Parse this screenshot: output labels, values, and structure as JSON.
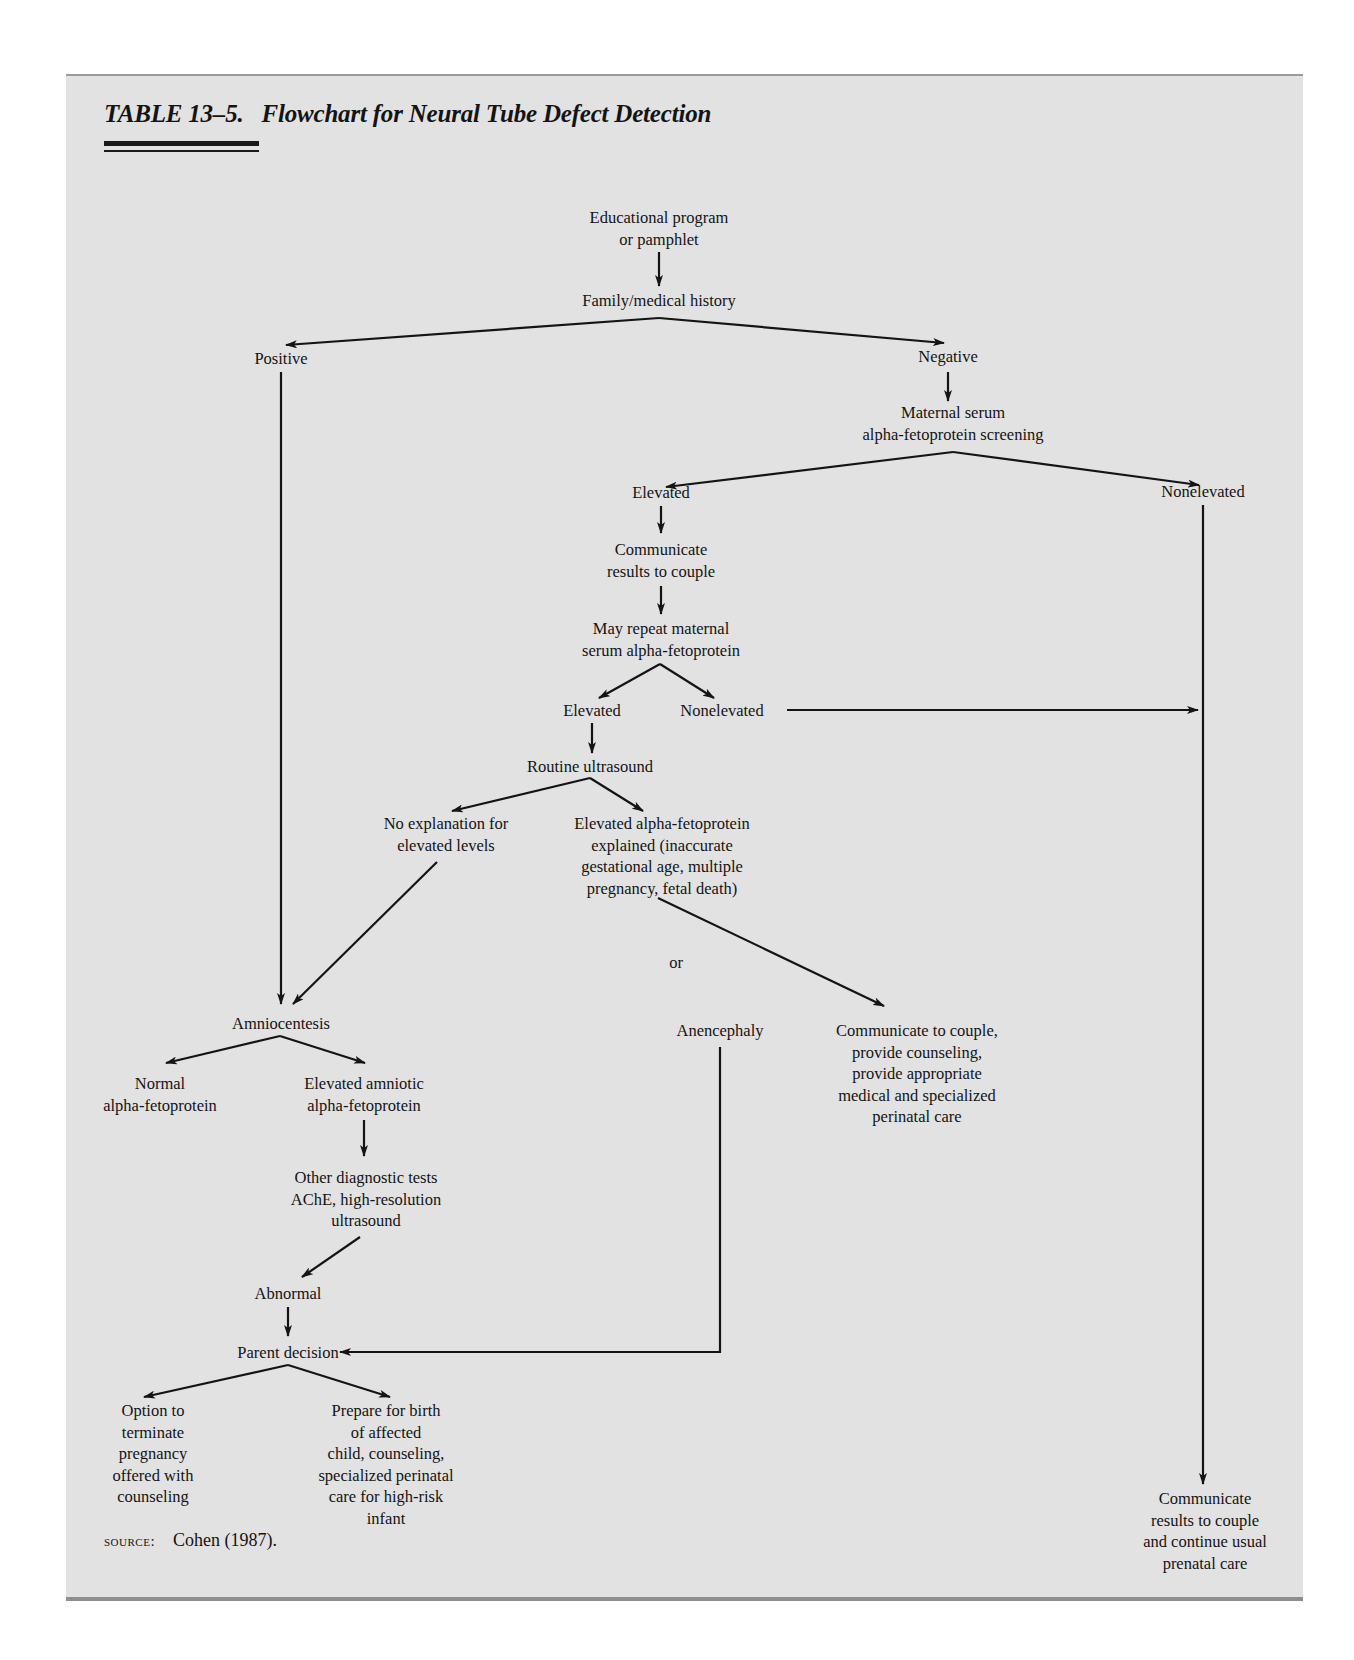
{
  "table": {
    "number": "TABLE 13–5.",
    "title": "Flowchart for Neural Tube Defect Detection"
  },
  "nodes": {
    "educational": "Educational program\nor pamphlet",
    "family_history": "Family/medical history",
    "positive": "Positive",
    "negative": "Negative",
    "msafp_screening": "Maternal serum\nalpha-fetoprotein screening",
    "elevated_1": "Elevated",
    "nonelevated_1": "Nonelevated",
    "communicate_results": "Communicate\nresults to couple",
    "may_repeat": "May repeat maternal\nserum alpha-fetoprotein",
    "elevated_2": "Elevated",
    "nonelevated_2": "Nonelevated",
    "routine_ultrasound": "Routine ultrasound",
    "no_explanation": "No explanation for\nelevated levels",
    "afp_explained": "Elevated alpha-fetoprotein\nexplained (inaccurate\ngestational age, multiple\npregnancy, fetal death)",
    "or": "or",
    "amniocentesis": "Amniocentesis",
    "anencephaly": "Anencephaly",
    "communicate_counseling": "Communicate to couple,\nprovide counseling,\nprovide appropriate\nmedical and specialized\nperinatal care",
    "normal_afp": "Normal\nalpha-fetoprotein",
    "elevated_amniotic": "Elevated amniotic\nalpha-fetoprotein",
    "other_tests": "Other diagnostic tests\nAChE, high-resolution\nultrasound",
    "abnormal": "Abnormal",
    "parent_decision": "Parent decision",
    "option_terminate": "Option to\nterminate\npregnancy\noffered with\ncounseling",
    "prepare_birth": "Prepare for birth\nof affected\nchild, counseling,\nspecialized perinatal\ncare for high-risk\ninfant",
    "communicate_usual": "Communicate\nresults to couple\nand continue usual\nprenatal care"
  },
  "source": {
    "label": "SOURCE:",
    "citation": "Cohen (1987)."
  }
}
